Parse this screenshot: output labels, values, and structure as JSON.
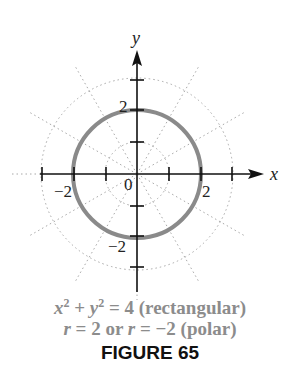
{
  "figure": {
    "axis_x_label": "x",
    "axis_y_label": "y",
    "origin_label": "0",
    "tick_labels": {
      "x_neg": "−2",
      "x_pos": "2",
      "y_pos": "2",
      "y_neg": "−2"
    },
    "circle_radius": 2,
    "polar_grid": {
      "circle_radii": [
        1,
        2,
        3
      ],
      "radial_angle_step_deg": 30
    },
    "colors": {
      "circle": "#8a8a8a",
      "axes": "#111111",
      "grid": "#a0a0a0",
      "caption": "#8c8c8c"
    }
  },
  "caption": {
    "line1_eq_lhs_x": "x",
    "line1_exp": "2",
    "line1_plus": " + ",
    "line1_eq_lhs_y": "y",
    "line1_rest": " = 4 (rectangular)",
    "line2_r1": "r",
    "line2_mid": " = 2 or ",
    "line2_r2": "r",
    "line2_rest": " = −2 (polar)"
  },
  "figure_label": "FIGURE 65"
}
